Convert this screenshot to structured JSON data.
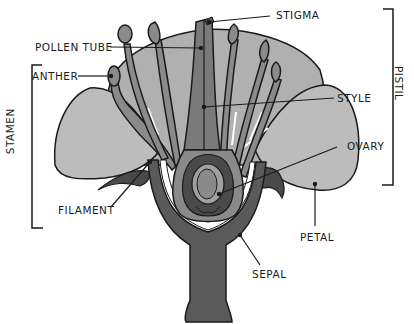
{
  "diagram": {
    "colors": {
      "background": "#ffffff",
      "outline": "#1a1a1a",
      "petal": "#b8b8b8",
      "petal_back": "#a8a8a8",
      "stamen": "#8a8a8a",
      "pistil": "#7a7a7a",
      "dark": "#4a4a4a",
      "ovule": "#9a9a9a"
    },
    "labels": {
      "stigma": "STIGMA",
      "pollen_tube": "POLLEN TUBE",
      "anther": "ANTHER",
      "style": "STYLE",
      "ovary": "OVARY",
      "filament": "FILAMENT",
      "petal": "PETAL",
      "sepal": "SEPAL"
    },
    "groups": {
      "stamen": "STAMEN",
      "pistil": "PISTIL"
    }
  }
}
